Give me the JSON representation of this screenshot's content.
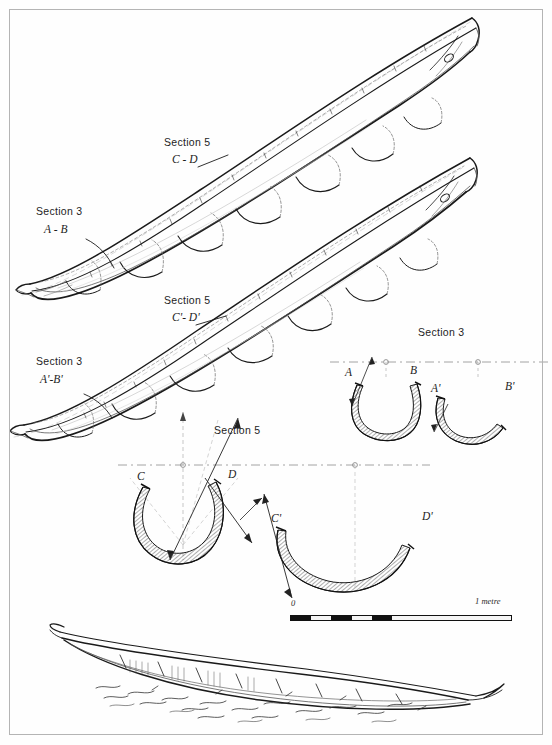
{
  "plate": {
    "title": "Bark canoe construction plate",
    "background_color": "#fefefe",
    "border_color": "#b4b4b4",
    "ink_color": "#1a1a1a"
  },
  "canoe_upper": {
    "name": "upper-canoe-perspective",
    "section5_label": "Section 5",
    "section5_points": "C - D",
    "section3_label": "Section 3",
    "section3_points": "A - B"
  },
  "canoe_lower": {
    "name": "lower-canoe-perspective",
    "section5_label": "Section 5",
    "section5_points": "C'- D'",
    "section3_label": "Section 3",
    "section3_points": "A'-B'"
  },
  "section3_group": {
    "heading": "Section 3",
    "cross_sections": [
      {
        "left_label": "A",
        "right_label": "B",
        "shape": "deep-u"
      },
      {
        "left_label": "A'",
        "right_label": "B'",
        "shape": "shallow-u"
      }
    ]
  },
  "section5_group": {
    "heading": "Section 5",
    "cross_sections": [
      {
        "left_label": "C",
        "right_label": "D",
        "shape": "deep-u"
      },
      {
        "left_label": "C'",
        "right_label": "D'",
        "shape": "shallow-u"
      }
    ]
  },
  "scale": {
    "zero_label": "0",
    "end_label": "1 metre",
    "segments": [
      "dark",
      "light",
      "dark",
      "light",
      "dark",
      "light"
    ],
    "tail": "light"
  },
  "bottom_view": {
    "name": "canoe-profile-on-ground",
    "caption": ""
  }
}
